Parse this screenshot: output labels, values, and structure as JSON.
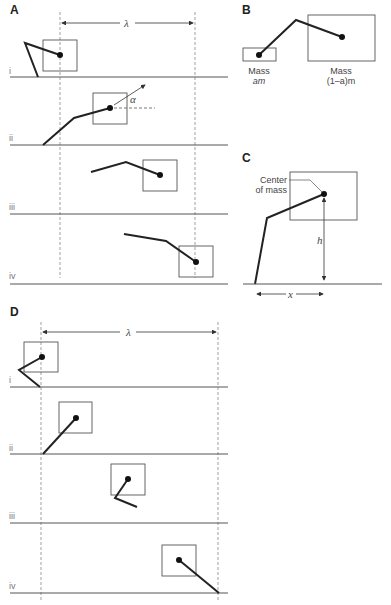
{
  "figure": {
    "panels": {
      "A": {
        "letter": "A",
        "lambda_label": "λ",
        "alpha_label": "α",
        "rows": [
          {
            "label": "i"
          },
          {
            "label": "ii"
          },
          {
            "label": "iii"
          },
          {
            "label": "iv"
          }
        ]
      },
      "B": {
        "letter": "B",
        "small_mass_line1": "Mass",
        "small_mass_line2": "am",
        "large_mass_line1": "Mass",
        "large_mass_line2": "(1–a)m"
      },
      "C": {
        "letter": "C",
        "com_line1": "Center",
        "com_line2": "of mass",
        "h_label": "h",
        "x_label": "x"
      },
      "D": {
        "letter": "D",
        "lambda_label": "λ",
        "rows": [
          {
            "label": "i"
          },
          {
            "label": "ii"
          },
          {
            "label": "iii"
          },
          {
            "label": "iv"
          }
        ]
      }
    },
    "colors": {
      "line": "#222222",
      "box": "#555555",
      "dashed": "#888888",
      "ground": "#555555"
    }
  }
}
